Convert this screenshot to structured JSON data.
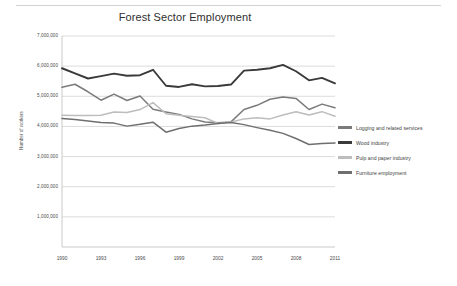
{
  "figure": {
    "title": "Forest Sector Employment"
  },
  "chart_data": {
    "type": "line",
    "title": "Forest Sector Employment",
    "xlabel": "",
    "ylabel": "Number of workers",
    "grid": true,
    "legend_position": "right",
    "xlim": [
      1990,
      2011
    ],
    "ylim": [
      0,
      7000000
    ],
    "ytick_labels": [
      "7,000,000",
      "6,000,000",
      "5,000,000",
      "4,000,000",
      "3,000,000",
      "2,000,000",
      "1,000,000"
    ],
    "ytick_values": [
      7000000,
      6000000,
      5000000,
      4000000,
      3000000,
      2000000,
      1000000
    ],
    "xtick_labels": [
      "1990",
      "1993",
      "1996",
      "1999",
      "2002",
      "2005",
      "2008",
      "2011"
    ],
    "xtick_values": [
      1990,
      1993,
      1996,
      1999,
      2002,
      2005,
      2008,
      2011
    ],
    "x": [
      1990,
      1991,
      1992,
      1993,
      1994,
      1995,
      1996,
      1997,
      1998,
      1999,
      2000,
      2001,
      2002,
      2003,
      2004,
      2005,
      2006,
      2007,
      2008,
      2009,
      2010,
      2011
    ],
    "series": [
      {
        "name": "Logging and related services",
        "color": "#7b7b7b",
        "values": [
          5300000,
          5400000,
          5150000,
          4870000,
          5070000,
          4860000,
          5010000,
          4570000,
          4480000,
          4400000,
          4250000,
          4150000,
          4120000,
          4150000,
          4560000,
          4700000,
          4900000,
          4980000,
          4930000,
          4560000,
          4740000,
          4620000
        ]
      },
      {
        "name": "Wood industry",
        "color": "#3a3a3a",
        "values": [
          5930000,
          5760000,
          5590000,
          5670000,
          5750000,
          5680000,
          5700000,
          5880000,
          5350000,
          5310000,
          5400000,
          5330000,
          5340000,
          5390000,
          5850000,
          5880000,
          5930000,
          6040000,
          5830000,
          5530000,
          5610000,
          5430000
        ]
      },
      {
        "name": "Pulp and paper industry",
        "color": "#bdbdbd",
        "values": [
          4370000,
          4360000,
          4360000,
          4370000,
          4480000,
          4460000,
          4560000,
          4790000,
          4420000,
          4370000,
          4330000,
          4290000,
          4100000,
          4150000,
          4250000,
          4290000,
          4250000,
          4380000,
          4490000,
          4380000,
          4490000,
          4340000
        ]
      },
      {
        "name": "Furniture employment",
        "color": "#6f6f6f",
        "values": [
          4260000,
          4230000,
          4180000,
          4130000,
          4110000,
          4010000,
          4070000,
          4140000,
          3810000,
          3930000,
          4010000,
          4050000,
          4100000,
          4130000,
          4060000,
          3960000,
          3870000,
          3770000,
          3600000,
          3400000,
          3430000,
          3450000
        ]
      }
    ]
  },
  "legend": {
    "items": [
      {
        "label": "Logging and related services",
        "color": "#7b7b7b"
      },
      {
        "label": "Wood industry",
        "color": "#3a3a3a"
      },
      {
        "label": "Pulp and paper industry",
        "color": "#bdbdbd"
      },
      {
        "label": "Furniture employment",
        "color": "#6f6f6f"
      }
    ]
  }
}
